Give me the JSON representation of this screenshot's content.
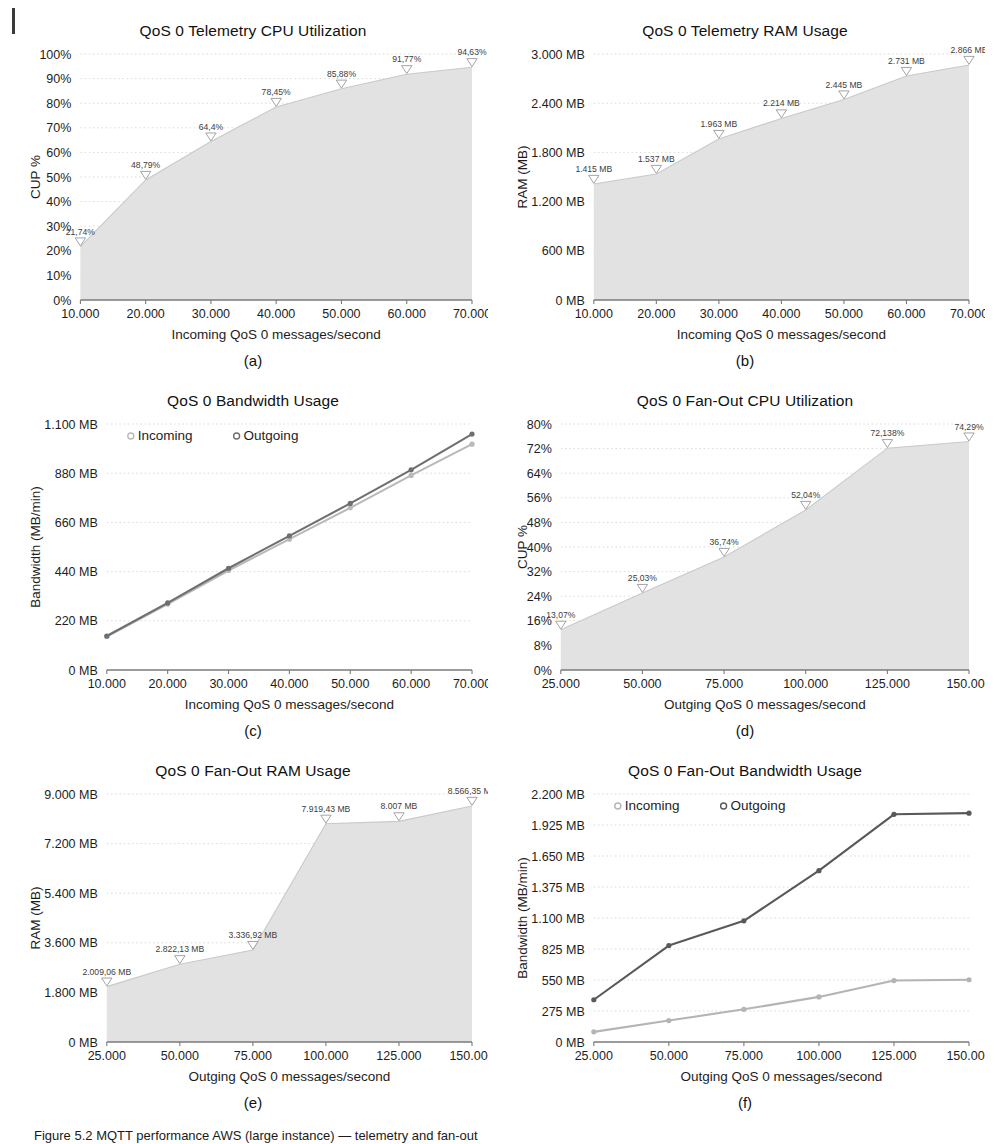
{
  "figure": {
    "caption_prefix": "Figure 5.2",
    "caption_text": "Figure 5.2  MQTT performance AWS (large instance) — telemetry and fan-out"
  },
  "panels": [
    {
      "key": "a",
      "caption": "(a)",
      "chart_data": {
        "type": "area",
        "title": "QoS 0 Telemetry CPU Utilization",
        "xlabel": "Incoming QoS 0 messages/second",
        "ylabel": "CUP %",
        "x": [
          10000,
          20000,
          30000,
          40000,
          50000,
          60000,
          70000
        ],
        "xticklabels": [
          "10.000",
          "20.000",
          "30.000",
          "40.000",
          "50.000",
          "60.000",
          "70.000"
        ],
        "yticks": [
          0,
          10,
          20,
          30,
          40,
          50,
          60,
          70,
          80,
          90,
          100
        ],
        "yticklabels": [
          "0%",
          "10%",
          "20%",
          "30%",
          "40%",
          "50%",
          "60%",
          "70%",
          "80%",
          "90%",
          "100%"
        ],
        "ylim": [
          0,
          100
        ],
        "values": [
          21.74,
          48.79,
          64.4,
          78.45,
          85.88,
          91.77,
          94.63
        ],
        "point_labels": [
          "21,74%",
          "48,79%",
          "64,4%",
          "78,45%",
          "85,88%",
          "91,77%",
          "94,63%"
        ],
        "marker": "triangle-down",
        "grid": true,
        "legend": null
      }
    },
    {
      "key": "b",
      "caption": "(b)",
      "chart_data": {
        "type": "area",
        "title": "QoS 0 Telemetry RAM Usage",
        "xlabel": "Incoming QoS 0 messages/second",
        "ylabel": "RAM (MB)",
        "x": [
          10000,
          20000,
          30000,
          40000,
          50000,
          60000,
          70000
        ],
        "xticklabels": [
          "10.000",
          "20.000",
          "30.000",
          "40.000",
          "50.000",
          "60.000",
          "70.000"
        ],
        "yticks": [
          0,
          600,
          1200,
          1800,
          2400,
          3000
        ],
        "yticklabels": [
          "0 MB",
          "600 MB",
          "1.200 MB",
          "1.800 MB",
          "2.400 MB",
          "3.000 MB"
        ],
        "ylim": [
          0,
          3000
        ],
        "values": [
          1415,
          1537,
          1963,
          2214,
          2445,
          2731,
          2866
        ],
        "point_labels": [
          "1.415 MB",
          "1.537 MB",
          "1.963 MB",
          "2.214 MB",
          "2.445 MB",
          "2.731 MB",
          "2.866 MB"
        ],
        "marker": "triangle-down",
        "grid": true,
        "legend": null
      }
    },
    {
      "key": "c",
      "caption": "(c)",
      "chart_data": {
        "type": "line",
        "title": "QoS 0 Bandwidth Usage",
        "xlabel": "Incoming QoS 0 messages/second",
        "ylabel": "Bandwidth (MB/min)",
        "x": [
          10000,
          20000,
          30000,
          40000,
          50000,
          60000,
          70000
        ],
        "xticklabels": [
          "10.000",
          "20.000",
          "30.000",
          "40.000",
          "50.000",
          "60.000",
          "70.000"
        ],
        "yticks": [
          0,
          220,
          440,
          660,
          880,
          1100
        ],
        "yticklabels": [
          "0 MB",
          "220 MB",
          "440 MB",
          "660 MB",
          "880 MB",
          "1.100 MB"
        ],
        "ylim": [
          0,
          1100
        ],
        "series": [
          {
            "name": "Incoming",
            "color": "#b9b9b9",
            "values": [
              150,
              295,
              445,
              585,
              725,
              870,
              1010
            ]
          },
          {
            "name": "Outgoing",
            "color": "#6f6f6f",
            "values": [
              152,
              300,
              455,
              600,
              745,
              895,
              1055
            ]
          }
        ],
        "grid": true,
        "legend": [
          "Incoming",
          "Outgoing"
        ],
        "legend_position": "top-left"
      }
    },
    {
      "key": "d",
      "caption": "(d)",
      "chart_data": {
        "type": "area",
        "title": "QoS 0 Fan-Out CPU Utilization",
        "xlabel": "Outging QoS 0 messages/second",
        "ylabel": "CUP %",
        "x": [
          25000,
          50000,
          75000,
          100000,
          125000,
          150000
        ],
        "xticklabels": [
          "25.000",
          "50.000",
          "75.000",
          "100.000",
          "125.000",
          "150.000"
        ],
        "yticks": [
          0,
          8,
          16,
          24,
          32,
          40,
          48,
          56,
          64,
          72,
          80
        ],
        "yticklabels": [
          "0%",
          "8%",
          "16%",
          "24%",
          "32%",
          "40%",
          "48%",
          "56%",
          "64%",
          "72%",
          "80%"
        ],
        "ylim": [
          0,
          80
        ],
        "values": [
          13.07,
          25.03,
          36.74,
          52.04,
          72.138,
          74.29
        ],
        "point_labels": [
          "13,07%",
          "25,03%",
          "36,74%",
          "52,04%",
          "72,138%",
          "74,29%"
        ],
        "marker": "triangle-down",
        "grid": true,
        "legend": null
      }
    },
    {
      "key": "e",
      "caption": "(e)",
      "chart_data": {
        "type": "area",
        "title": "QoS 0 Fan-Out RAM Usage",
        "xlabel": "Outging QoS 0 messages/second",
        "ylabel": "RAM (MB)",
        "x": [
          25000,
          50000,
          75000,
          100000,
          125000,
          150000
        ],
        "xticklabels": [
          "25.000",
          "50.000",
          "75.000",
          "100.000",
          "125.000",
          "150.000"
        ],
        "yticks": [
          0,
          1800,
          3600,
          5400,
          7200,
          9000
        ],
        "yticklabels": [
          "0 MB",
          "1.800 MB",
          "3.600 MB",
          "5.400 MB",
          "7.200 MB",
          "9.000 MB"
        ],
        "ylim": [
          0,
          9000
        ],
        "values": [
          2009.06,
          2822.13,
          3336.92,
          7919.43,
          8007,
          8566.35
        ],
        "point_labels": [
          "2.009,06 MB",
          "2.822,13 MB",
          "3.336,92 MB",
          "7.919,43 MB",
          "8.007 MB",
          "8.566,35 MB"
        ],
        "marker": "triangle-down",
        "grid": true,
        "legend": null
      }
    },
    {
      "key": "f",
      "caption": "(f)",
      "chart_data": {
        "type": "line",
        "title": "QoS 0 Fan-Out Bandwidth Usage",
        "xlabel": "Outging QoS 0 messages/second",
        "ylabel": "Bandwidth (MB/min)",
        "x": [
          25000,
          50000,
          75000,
          100000,
          125000,
          150000
        ],
        "xticklabels": [
          "25.000",
          "50.000",
          "75.000",
          "100.000",
          "125.000",
          "150.000"
        ],
        "yticks": [
          0,
          275,
          550,
          825,
          1100,
          1375,
          1650,
          1925,
          2200
        ],
        "yticklabels": [
          "0 MB",
          "275 MB",
          "550 MB",
          "825 MB",
          "1.100 MB",
          "1.375 MB",
          "1.650 MB",
          "1.925 MB",
          "2.200 MB"
        ],
        "ylim": [
          0,
          2200
        ],
        "series": [
          {
            "name": "Incoming",
            "color": "#b4b4b4",
            "values": [
              90,
              190,
              290,
              400,
              545,
              552
            ]
          },
          {
            "name": "Outgoing",
            "color": "#595959",
            "values": [
              375,
              855,
              1075,
              1520,
              2020,
              2030
            ]
          }
        ],
        "grid": true,
        "legend": [
          "Incoming",
          "Outgoing"
        ],
        "legend_position": "top-left"
      }
    }
  ],
  "style": {
    "area_fill": "#e2e2e2",
    "area_line": "#c9c9c9",
    "axis_color": "#7a7a7a",
    "grid_color": "#d8d8d8",
    "text_color": "#1d1d1d"
  }
}
